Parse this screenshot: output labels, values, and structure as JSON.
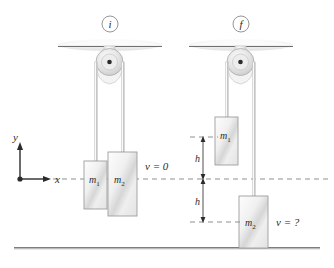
{
  "figure": {
    "kind": "physics-diagram",
    "background": "#ffffff"
  },
  "colors": {
    "ink": "#2b2b2b",
    "line": "#6f6f6f",
    "dash": "#8a8a8a",
    "block_edge": "#9a9a9a",
    "block_light": "#fbfbfb",
    "block_mid": "#e2e2e2",
    "block_shade": "#c7c7c7",
    "pulley_edge": "#b5b5b5",
    "pulley_fill": "#e8e8e8",
    "ceiling_fill": "#f2f2f2",
    "rope": "#b9b9b9",
    "ground": "#8d8d8d"
  },
  "panels": [
    {
      "id": "initial",
      "badge": "i",
      "velocity_label": "v = 0",
      "blocks": [
        {
          "name": "m1",
          "label": "m",
          "subscript": "1"
        },
        {
          "name": "m2",
          "label": "m",
          "subscript": "2"
        }
      ]
    },
    {
      "id": "final",
      "badge": "f",
      "velocity_label": "v = ?",
      "blocks": [
        {
          "name": "m1",
          "label": "m",
          "subscript": "1"
        },
        {
          "name": "m2",
          "label": "m",
          "subscript": "2"
        }
      ]
    }
  ],
  "axes": {
    "y_label": "y",
    "x_label": "x",
    "origin_marker": "origin-dot"
  },
  "dimensions": [
    {
      "id": "h-upper",
      "label": "h"
    },
    {
      "id": "h-lower",
      "label": "h"
    }
  ],
  "annotations": {
    "initial_velocity": "v = 0",
    "final_velocity": "v = ?",
    "badge_initial": "i",
    "badge_final": "f"
  }
}
